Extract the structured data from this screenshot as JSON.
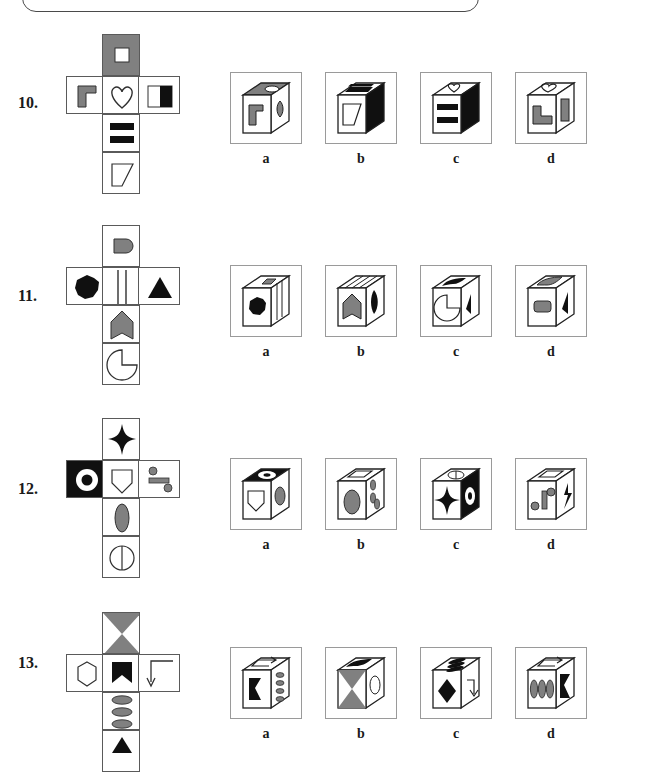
{
  "page": {
    "kind": "spatial-reasoning-cube-folding-worksheet",
    "top_box_visible": true
  },
  "palette": {
    "gray": "#808080",
    "black": "#101010",
    "white": "#ffffff",
    "cell_border": "#5a5a5a",
    "frame_border": "#9a9a9a",
    "top_box_border": "#4a4a4a"
  },
  "option_labels": [
    "a",
    "b",
    "c",
    "d"
  ],
  "questions": [
    {
      "number": "10.",
      "net": {
        "top": {
          "fill": "gray",
          "shape": "small-white-square"
        },
        "left": {
          "fill": "white",
          "shape": "gray-corner-bracket"
        },
        "middle": {
          "fill": "white",
          "shape": "heart-outline"
        },
        "right": {
          "fill": "white",
          "shape": "half-black-rectangle"
        },
        "bottom1": {
          "fill": "white",
          "shape": "two-black-bars"
        },
        "bottom2": {
          "fill": "white",
          "shape": "trapezoid-outline"
        }
      },
      "options": [
        {
          "label": "a",
          "top_face": "gray-with-white-slot",
          "front_face": "gray-corner-bracket",
          "side_face": "gray-heart"
        },
        {
          "label": "b",
          "top_face": "two-black-bars",
          "front_face": "trapezoid-outline",
          "side_face": "black-solid"
        },
        {
          "label": "c",
          "top_face": "heart-outline",
          "front_face": "two-black-bars",
          "side_face": "black-solid"
        },
        {
          "label": "d",
          "top_face": "heart-outline",
          "front_face": "gray-corner-bracket",
          "side_face": "gray-bar"
        }
      ]
    },
    {
      "number": "11.",
      "net": {
        "top": {
          "fill": "white",
          "shape": "gray-rounded-rect"
        },
        "left": {
          "fill": "white",
          "shape": "black-octagon-blob"
        },
        "middle": {
          "fill": "white",
          "shape": "two-vertical-lines"
        },
        "right": {
          "fill": "white",
          "shape": "black-triangle"
        },
        "bottom1": {
          "fill": "white",
          "shape": "gray-pennant-shield"
        },
        "bottom2": {
          "fill": "white",
          "shape": "pacman-circle"
        }
      },
      "options": [
        {
          "label": "a",
          "top_face": "gray-rounded-rect",
          "front_face": "black-octagon-blob",
          "side_face": "vertical-lines"
        },
        {
          "label": "b",
          "top_face": "vertical-lines",
          "front_face": "gray-pennant-shield",
          "side_face": "black-blob"
        },
        {
          "label": "c",
          "top_face": "black-flag",
          "front_face": "pacman-circle",
          "side_face": "black-triangle"
        },
        {
          "label": "d",
          "top_face": "gray-flag",
          "front_face": "gray-rounded-rect",
          "side_face": "black-triangle"
        }
      ]
    },
    {
      "number": "12.",
      "net": {
        "top": {
          "fill": "white",
          "shape": "black-four-point-star"
        },
        "left": {
          "fill": "black",
          "shape": "white-ring"
        },
        "middle": {
          "fill": "white",
          "shape": "pentagon-shield-outline"
        },
        "right": {
          "fill": "white",
          "shape": "two-dots-and-bar"
        },
        "bottom1": {
          "fill": "white",
          "shape": "gray-ellipse"
        },
        "bottom2": {
          "fill": "white",
          "shape": "split-circle"
        }
      },
      "options": [
        {
          "label": "a",
          "top_face": "black-with-white-ring",
          "front_face": "pentagon-shield-outline",
          "side_face": "gray-ellipse"
        },
        {
          "label": "b",
          "top_face": "rounded-slot-outline",
          "front_face": "gray-ellipse",
          "side_face": "gray-dashes"
        },
        {
          "label": "c",
          "top_face": "split-circle",
          "front_face": "black-four-point-star",
          "side_face": "black-with-white-ring"
        },
        {
          "label": "d",
          "top_face": "rounded-slot-outline",
          "front_face": "two-dots-and-bar",
          "side_face": "black-star-half"
        }
      ]
    },
    {
      "number": "13.",
      "net": {
        "top": {
          "fill": "white",
          "shape": "gray-hourglass-bowtie"
        },
        "left": {
          "fill": "white",
          "shape": "hexagon-outline"
        },
        "middle": {
          "fill": "white",
          "shape": "black-crown-notch"
        },
        "right": {
          "fill": "white",
          "shape": "hook-arrow"
        },
        "bottom1": {
          "fill": "white",
          "shape": "three-gray-ellipses"
        },
        "bottom2": {
          "fill": "white",
          "shape": "partial-black-triangle"
        }
      },
      "options": [
        {
          "label": "a",
          "top_face": "hook-arrow",
          "front_face": "black-crown-notch",
          "side_face": "gray-dashes"
        },
        {
          "label": "b",
          "top_face": "black-flag",
          "front_face": "gray-hourglass-bowtie",
          "side_face": "ellipse-outline"
        },
        {
          "label": "c",
          "top_face": "black-dashes",
          "front_face": "black-diamond",
          "side_face": "hook-arrow"
        },
        {
          "label": "d",
          "top_face": "hook-arrow",
          "front_face": "three-gray-ellipses",
          "side_face": "black-arrow"
        }
      ]
    }
  ]
}
